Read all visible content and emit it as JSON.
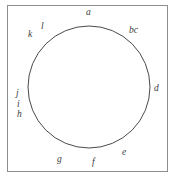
{
  "figure": {
    "background_color": "#ffffff",
    "frame": {
      "stroke_color": "#8d8d8d",
      "x": 7,
      "y": 5,
      "width": 161,
      "height": 167
    },
    "circle": {
      "center_x": 89,
      "center_y": 87,
      "radius": 61,
      "stroke_color": "#4a4a4a",
      "stroke_width": 1,
      "fill": "none"
    },
    "labels": [
      {
        "id": "a",
        "text": "a",
        "x": 86,
        "y": 8,
        "angle_deg": 90
      },
      {
        "id": "bc",
        "text": "bc",
        "x": 129,
        "y": 26,
        "angle_deg": 55
      },
      {
        "id": "d",
        "text": "d",
        "x": 154,
        "y": 84,
        "angle_deg": 3
      },
      {
        "id": "e",
        "text": "e",
        "x": 122,
        "y": 148,
        "angle_deg": -53
      },
      {
        "id": "f",
        "text": "f",
        "x": 92,
        "y": 158,
        "angle_deg": -88
      },
      {
        "id": "g",
        "text": "g",
        "x": 57,
        "y": 155,
        "angle_deg": -112
      },
      {
        "id": "h",
        "text": "h",
        "x": 17,
        "y": 110,
        "angle_deg": 196
      },
      {
        "id": "i",
        "text": "i",
        "x": 17,
        "y": 100,
        "angle_deg": 186
      },
      {
        "id": "j",
        "text": "j",
        "x": 16,
        "y": 89,
        "angle_deg": 180
      },
      {
        "id": "k",
        "text": "k",
        "x": 28,
        "y": 30,
        "angle_deg": 134
      },
      {
        "id": "l",
        "text": "l",
        "x": 41,
        "y": 22,
        "angle_deg": 122
      }
    ]
  }
}
